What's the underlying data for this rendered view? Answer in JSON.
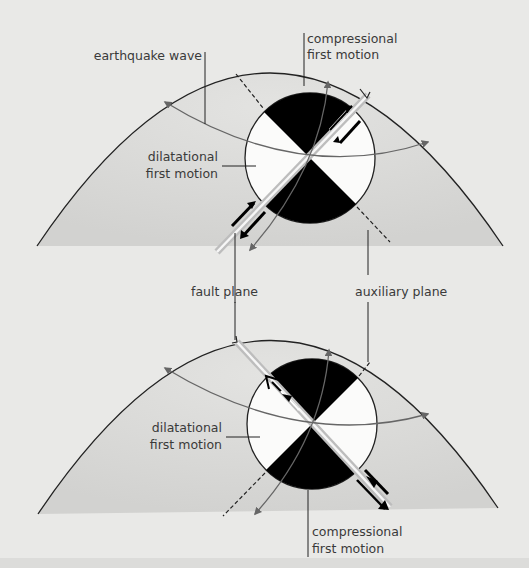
{
  "figure": {
    "colors": {
      "background": "#e9e9e7",
      "earth_shading": "#d6d6d4",
      "compressional_quadrant": "#000000",
      "dilatational_quadrant": "#fbfbfa",
      "ray_arrow": "#666666",
      "outline": "#222222"
    },
    "top_panel": {
      "labels": {
        "earthquake_wave": "earthquake wave",
        "compressional_line1": "compressional",
        "compressional_line2": "first motion",
        "dilatational_line1": "dilatational",
        "dilatational_line2": "first motion"
      },
      "fault_plane_orientation": "SW-NE",
      "auxiliary_plane_orientation": "NW-SE (dashed)"
    },
    "middle_labels": {
      "fault_plane": "fault plane",
      "auxiliary_plane": "auxiliary plane"
    },
    "bottom_panel": {
      "labels": {
        "dilatational_line1": "dilatational",
        "dilatational_line2": "first motion",
        "compressional_line1": "compressional",
        "compressional_line2": "first motion"
      },
      "fault_plane_orientation": "NW-SE",
      "auxiliary_plane_orientation": "SW-NE (dashed)"
    }
  }
}
